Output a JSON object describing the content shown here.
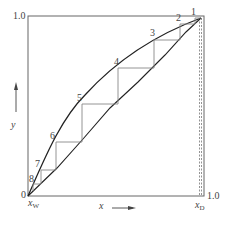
{
  "diagram": {
    "type": "McCabe-Thiele stage construction",
    "axes": {
      "x_label": "x",
      "y_label": "y",
      "x_max_label": "1.0",
      "y_max_label": "1.0",
      "origin_label": "0",
      "x_w_label": "x",
      "x_w_sub": "W",
      "x_d_label": "x",
      "x_d_sub": "D"
    },
    "stage_labels": [
      "1",
      "2",
      "3",
      "4",
      "5",
      "6",
      "7",
      "8"
    ],
    "colors": {
      "frame": "#555555",
      "curve": "#222222",
      "steps": "#777777",
      "text": "#444444"
    }
  }
}
